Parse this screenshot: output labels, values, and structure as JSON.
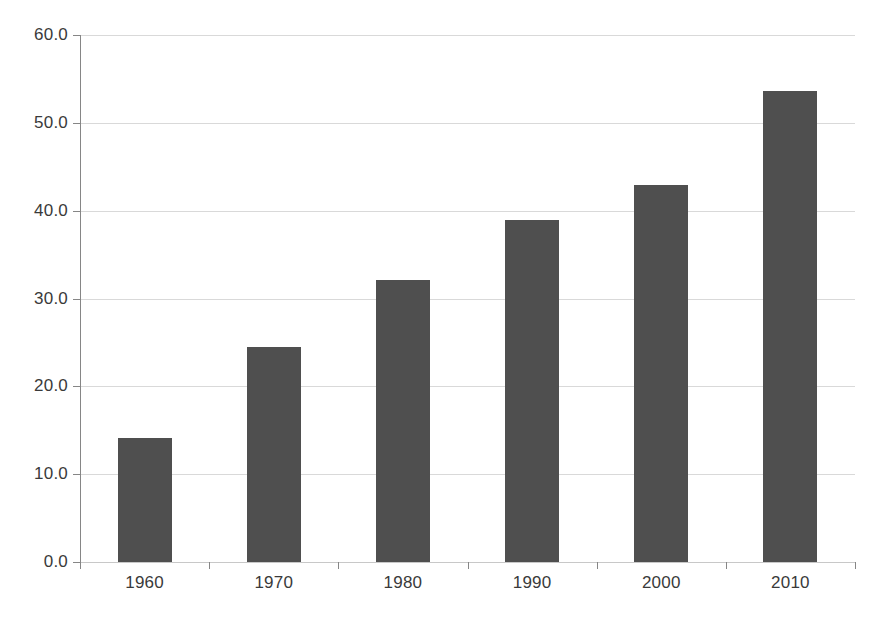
{
  "chart_data": {
    "type": "bar",
    "title": "",
    "subtitle": "",
    "xlabel": "",
    "ylabel": "",
    "categories": [
      "1960",
      "1970",
      "1980",
      "1990",
      "2000",
      "2010"
    ],
    "values": [
      14.1,
      24.5,
      32.1,
      38.9,
      42.9,
      53.6
    ],
    "ylim": [
      0.0,
      60.0
    ],
    "ytick_labels": [
      "0.0",
      "10.0",
      "20.0",
      "30.0",
      "40.0",
      "50.0",
      "60.0"
    ],
    "ytick_values": [
      0.0,
      10.0,
      20.0,
      30.0,
      40.0,
      50.0,
      60.0
    ],
    "grid": "horizontal",
    "legend": "none",
    "series": [
      {
        "name": "",
        "values": [
          14.1,
          24.5,
          32.1,
          38.9,
          42.9,
          53.6
        ]
      }
    ],
    "colors": {
      "bar_fill": "#4f4f4f",
      "gridline": "#d9d9d9",
      "axis_line": "#868686",
      "text": "#3a3a3a",
      "background": "#ffffff"
    }
  }
}
